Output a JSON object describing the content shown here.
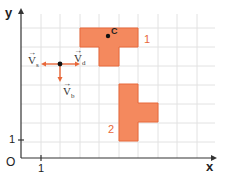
{
  "diagram": {
    "axes": {
      "x_label": "x",
      "y_label": "y",
      "origin_label": "O",
      "x_tick": "1",
      "y_tick": "1"
    },
    "colors": {
      "fill": "#F4895E",
      "stroke": "#E8683A",
      "grid": "#E2E2E2",
      "axis": "#333333",
      "vector": "#E8683A"
    },
    "shapes": [
      {
        "label": "1",
        "point_label": "C",
        "cells": [
          [
            3,
            6
          ],
          [
            4,
            6
          ],
          [
            5,
            6
          ],
          [
            4,
            5
          ]
        ]
      },
      {
        "label": "2",
        "cells": [
          [
            5,
            3
          ],
          [
            5,
            2
          ],
          [
            6,
            2
          ],
          [
            5,
            1
          ]
        ]
      }
    ],
    "vectors": [
      {
        "name": "V",
        "sub": "s",
        "direction": "left"
      },
      {
        "name": "V",
        "sub": "d",
        "direction": "right"
      },
      {
        "name": "V",
        "sub": "b",
        "direction": "down"
      }
    ]
  }
}
